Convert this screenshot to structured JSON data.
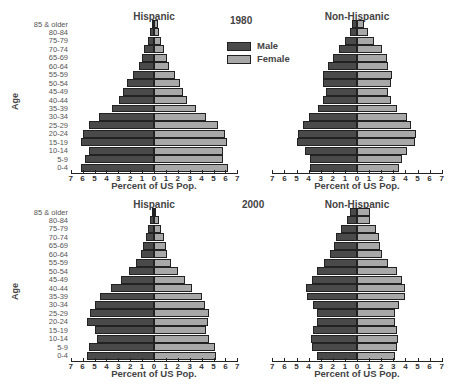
{
  "chart_data": [
    {
      "type": "bar",
      "subtype": "population-pyramid",
      "year": "1980",
      "title": "Hispanic",
      "xlabel": "Percent of US Pop.",
      "ylabel": "Age",
      "categories": [
        "85 & older",
        "80-84",
        "75-79",
        "70-74",
        "65-69",
        "60-64",
        "55-59",
        "50-54",
        "45-49",
        "40-44",
        "35-39",
        "30-34",
        "25-29",
        "20-24",
        "15-19",
        "10-14",
        "5-9",
        "0-4"
      ],
      "series": [
        {
          "name": "Male",
          "values": [
            0.2,
            0.3,
            0.5,
            0.8,
            1.0,
            1.3,
            1.8,
            2.3,
            2.6,
            2.9,
            3.5,
            4.6,
            5.5,
            6.0,
            6.1,
            5.5,
            5.8,
            6.1
          ]
        },
        {
          "name": "Female",
          "values": [
            0.3,
            0.4,
            0.6,
            0.8,
            1.1,
            1.3,
            1.8,
            2.2,
            2.4,
            2.8,
            3.5,
            4.4,
            5.4,
            6.0,
            6.1,
            5.8,
            5.8,
            6.2
          ]
        }
      ],
      "xlim": [
        -7,
        7
      ],
      "xticks": [
        7,
        6,
        5,
        4,
        3,
        2,
        1,
        0,
        1,
        2,
        3,
        4,
        5,
        6,
        7
      ]
    },
    {
      "type": "bar",
      "subtype": "population-pyramid",
      "year": "1980",
      "title": "Non-Hispanic",
      "xlabel": "Percent of US Pop.",
      "ylabel": "Age",
      "categories": [
        "85 & older",
        "80-84",
        "75-79",
        "70-74",
        "65-69",
        "60-64",
        "55-59",
        "50-54",
        "45-49",
        "40-44",
        "35-39",
        "30-34",
        "25-29",
        "20-24",
        "15-19",
        "10-14",
        "5-9",
        "0-4"
      ],
      "series": [
        {
          "name": "Male",
          "values": [
            0.4,
            0.6,
            1.0,
            1.5,
            2.0,
            2.4,
            2.8,
            2.8,
            2.6,
            2.8,
            3.2,
            4.0,
            4.5,
            4.9,
            5.0,
            4.3,
            3.9,
            3.9
          ]
        },
        {
          "name": "Female",
          "values": [
            0.6,
            0.9,
            1.4,
            2.1,
            2.5,
            2.6,
            2.9,
            2.8,
            2.6,
            2.8,
            3.3,
            4.1,
            4.5,
            4.9,
            4.8,
            4.1,
            3.7,
            3.5
          ]
        }
      ],
      "xlim": [
        -7,
        7
      ],
      "xticks": [
        7,
        6,
        5,
        4,
        3,
        2,
        1,
        0,
        1,
        2,
        3,
        4,
        5,
        6,
        7
      ]
    },
    {
      "type": "bar",
      "subtype": "population-pyramid",
      "year": "2000",
      "title": "Hispanic",
      "xlabel": "Percent of US Pop.",
      "ylabel": "Age",
      "categories": [
        "85 & older",
        "80-84",
        "75-79",
        "70-74",
        "65-69",
        "60-64",
        "55-59",
        "50-54",
        "45-49",
        "40-44",
        "35-39",
        "30-34",
        "25-29",
        "20-24",
        "15-19",
        "10-14",
        "5-9",
        "0-4"
      ],
      "series": [
        {
          "name": "Male",
          "values": [
            0.2,
            0.3,
            0.5,
            0.7,
            0.9,
            1.1,
            1.5,
            2.1,
            2.8,
            3.6,
            4.5,
            5.0,
            5.4,
            5.6,
            5.0,
            4.8,
            5.5,
            5.6
          ]
        },
        {
          "name": "Female",
          "values": [
            0.2,
            0.4,
            0.6,
            0.8,
            1.0,
            1.1,
            1.4,
            2.0,
            2.6,
            3.2,
            4.0,
            4.3,
            4.6,
            4.5,
            4.4,
            4.6,
            5.1,
            5.2
          ]
        }
      ],
      "xlim": [
        -7,
        7
      ],
      "xticks": [
        7,
        6,
        5,
        4,
        3,
        2,
        1,
        0,
        1,
        2,
        3,
        4,
        5,
        6,
        7
      ]
    },
    {
      "type": "bar",
      "subtype": "population-pyramid",
      "year": "2000",
      "title": "Non-Hispanic",
      "xlabel": "Percent of US Pop.",
      "ylabel": "Age",
      "categories": [
        "85 & older",
        "80-84",
        "75-79",
        "70-74",
        "65-69",
        "60-64",
        "55-59",
        "50-54",
        "45-49",
        "40-44",
        "35-39",
        "30-34",
        "25-29",
        "20-24",
        "15-19",
        "10-14",
        "5-9",
        "0-4"
      ],
      "series": [
        {
          "name": "Male",
          "values": [
            0.6,
            0.8,
            1.3,
            1.7,
            1.9,
            2.2,
            2.7,
            3.3,
            3.7,
            4.2,
            4.1,
            3.6,
            3.3,
            3.3,
            3.6,
            3.8,
            3.7,
            3.3
          ]
        },
        {
          "name": "Female",
          "values": [
            1.1,
            1.1,
            1.6,
            1.8,
            1.9,
            2.1,
            2.6,
            3.3,
            3.7,
            4.0,
            4.0,
            3.5,
            3.1,
            3.1,
            3.3,
            3.4,
            3.3,
            3.1
          ]
        }
      ],
      "xlim": [
        -7,
        7
      ],
      "xticks": [
        7,
        6,
        5,
        4,
        3,
        2,
        1,
        0,
        1,
        2,
        3,
        4,
        5,
        6,
        7
      ]
    }
  ],
  "labels": {
    "hispanic": "Hispanic",
    "non_hispanic": "Non-Hispanic",
    "year_1980": "1980",
    "year_2000": "2000",
    "age_axis": "Age",
    "x_axis": "Percent of US Pop.",
    "legend_male": "Male",
    "legend_female": "Female"
  },
  "colors": {
    "male": "#4a4a4a",
    "female": "#a8a8a8"
  }
}
